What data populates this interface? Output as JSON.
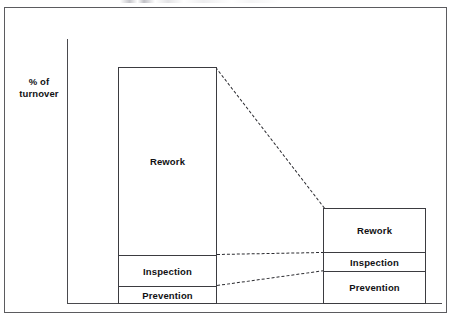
{
  "figure": {
    "axis_label_line1": "% of",
    "axis_label_line2": "turnover"
  },
  "chart_data": {
    "type": "bar",
    "title": "",
    "subtitle": "",
    "xlabel": "",
    "ylabel": "% of turnover",
    "grid": false,
    "legend": "none",
    "stacked": true,
    "axis_ticks": [],
    "annotation": "Dashed lines connect the corresponding segment boundaries of the 'before' bar to the shorter 'after' bar, showing the reduction in total quality cost as a percentage of turnover.",
    "categories": [
      "Before",
      "After"
    ],
    "segments": [
      "Prevention",
      "Inspection",
      "Rework"
    ],
    "series": [
      {
        "name": "Prevention",
        "values": [
          1.7,
          3.2
        ]
      },
      {
        "name": "Inspection",
        "values": [
          3.1,
          1.9
        ]
      },
      {
        "name": "Rework",
        "values": [
          18.7,
          4.3
        ]
      }
    ],
    "totals": [
      23.5,
      9.4
    ],
    "ylim": [
      0,
      26.5
    ],
    "bars": [
      {
        "label": "Before",
        "total": 23.5,
        "segments": [
          {
            "label": "Rework",
            "value": 18.7
          },
          {
            "label": "Inspection",
            "value": 3.1
          },
          {
            "label": "Prevention",
            "value": 1.7
          }
        ]
      },
      {
        "label": "After",
        "total": 9.4,
        "segments": [
          {
            "label": "Rework",
            "value": 4.3
          },
          {
            "label": "Inspection",
            "value": 1.9
          },
          {
            "label": "Prevention",
            "value": 3.2
          }
        ]
      }
    ],
    "connectors": [
      {
        "name": "top-of-bar",
        "from": "Before top",
        "to": "After top"
      },
      {
        "name": "rework-inspection-line",
        "from": "Before rework/inspection",
        "to": "After rework/inspection"
      },
      {
        "name": "inspection-prevention-line",
        "from": "Before inspection/prevention",
        "to": "After inspection/prevention"
      }
    ],
    "colors": {
      "bar_fill": "#ffffff",
      "bar_stroke": "#3b3b40",
      "axis": "#4a4a4e",
      "frame": "#5b5b5f",
      "text": "#111114",
      "dashed": "#2c2c31"
    }
  }
}
